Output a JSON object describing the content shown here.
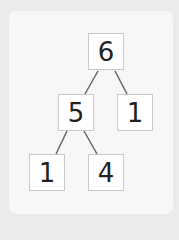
{
  "diagram": {
    "type": "number-bond-tree",
    "nodes": [
      {
        "id": "root",
        "value": "6"
      },
      {
        "id": "left",
        "value": "5"
      },
      {
        "id": "right",
        "value": "1"
      },
      {
        "id": "left-left",
        "value": "1"
      },
      {
        "id": "left-right",
        "value": "4"
      }
    ],
    "edges": [
      [
        "root",
        "left"
      ],
      [
        "root",
        "right"
      ],
      [
        "left",
        "left-left"
      ],
      [
        "left",
        "left-right"
      ]
    ],
    "colors": {
      "background": "#ebebeb",
      "card": "#f7f7f7",
      "box": "#ffffff",
      "line": "#666666"
    }
  }
}
